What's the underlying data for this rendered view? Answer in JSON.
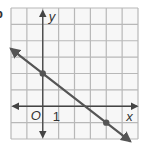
{
  "problem_label_partial": "b",
  "chart_data": {
    "type": "line",
    "title": "",
    "xlabel": "x",
    "ylabel": "y",
    "origin_label": "O",
    "tick_labels": [
      {
        "axis": "x",
        "value": 1,
        "label": "1"
      }
    ],
    "xlim": [
      -2,
      6
    ],
    "ylim": [
      -2,
      6
    ],
    "grid": true,
    "grid_step": 1,
    "series": [
      {
        "name": "line",
        "slope": -0.75,
        "intercept": 2,
        "marked_points": [
          {
            "x": 0,
            "y": 2
          },
          {
            "x": 4,
            "y": -1
          }
        ],
        "arrows": "both"
      }
    ],
    "legend": null
  },
  "colors": {
    "grid": "#b8b8b8",
    "axes": "#444444",
    "line": "#555555",
    "point": "#555555",
    "text": "#333333",
    "background": "#f7f7f7"
  }
}
